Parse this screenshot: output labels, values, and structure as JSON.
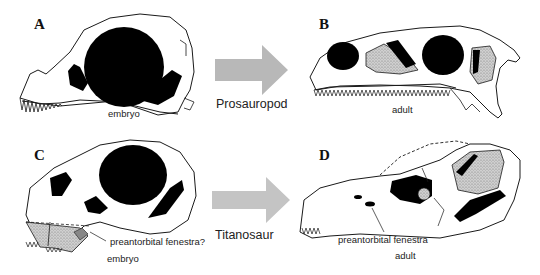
{
  "figure": {
    "panels": [
      {
        "letter": "A",
        "stage_label": "embryo",
        "group": "Prosauropod"
      },
      {
        "letter": "B",
        "stage_label": "adult",
        "group": "Prosauropod"
      },
      {
        "letter": "C",
        "stage_label": "embryo",
        "annotation": "preantorbital fenestra?",
        "group": "Titanosaur"
      },
      {
        "letter": "D",
        "stage_label": "adult",
        "annotation": "preantorbital fenestra",
        "group": "Titanosaur"
      }
    ],
    "arrows": [
      {
        "label": "Prosauropod",
        "color": "#b8b8b8"
      },
      {
        "label": "Titanosaur",
        "color": "#c4c4c4"
      }
    ],
    "colors": {
      "outline": "#1a1a1a",
      "fenestra_fill": "#000000",
      "stipple_fill": "#bdbdbd",
      "background": "#ffffff"
    }
  }
}
